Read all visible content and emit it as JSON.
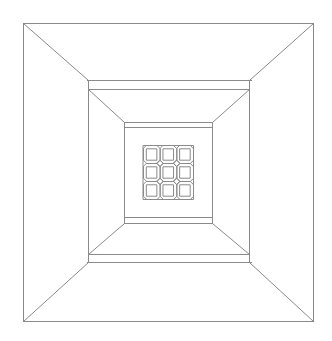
{
  "diagram": {
    "type": "perspective-line-drawing",
    "width": 332,
    "height": 341,
    "background": "#ffffff",
    "stroke_color": "#8a8a8a",
    "stroke_width": 1,
    "outer_frame": {
      "x1": 23,
      "y1": 23,
      "x2": 313,
      "y2": 321
    },
    "middle_frame": {
      "x1": 88,
      "x2": 249,
      "top_band": [
        80,
        89
      ],
      "bottom_band": [
        254,
        262
      ],
      "band_x": [
        87,
        251
      ]
    },
    "inner_frame": {
      "x1": 124,
      "x2": 212,
      "top_band": [
        122,
        127
      ],
      "bottom_band": [
        217,
        223
      ],
      "band_x": [
        124,
        212
      ]
    },
    "grid": {
      "x1": 143,
      "y1": 145,
      "x2": 193,
      "y2": 199,
      "cols": 3,
      "rows": 3,
      "cell_shape": "octagon-with-inner-square"
    }
  }
}
